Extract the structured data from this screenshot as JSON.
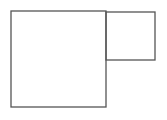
{
  "diagram": {
    "stroke_color": "#555555",
    "background": "#ffffff",
    "shapes": [
      {
        "name": "large-square",
        "x": 11,
        "y": 11,
        "width": 95,
        "height": 96
      },
      {
        "name": "small-square",
        "x": 106,
        "y": 12,
        "width": 49,
        "height": 48
      }
    ]
  }
}
